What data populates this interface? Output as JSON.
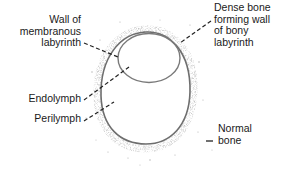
{
  "diagram": {
    "type": "anatomical-cross-section",
    "colors": {
      "outline": "#6e6e6e",
      "stipple": "#9a9a9a",
      "leader": "#222222",
      "text": "#1a1a1a",
      "background": "#ffffff"
    },
    "labels": {
      "wall_membranous": {
        "lines": [
          "Wall of",
          "membranous",
          "labyrinth"
        ]
      },
      "dense_bone": {
        "lines": [
          "Dense bone",
          "forming wall",
          "of bony",
          "labyrinth"
        ]
      },
      "endolymph": {
        "lines": [
          "Endolymph"
        ]
      },
      "perilymph": {
        "lines": [
          "Perilymph"
        ]
      },
      "normal_bone": {
        "lines": [
          "Normal",
          "bone"
        ]
      }
    }
  }
}
